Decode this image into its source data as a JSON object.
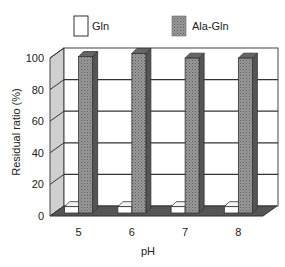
{
  "chart_data": {
    "type": "bar",
    "style": "3d-grouped",
    "title": "",
    "xlabel": "pH",
    "ylabel": "Residual ratio (%)",
    "categories": [
      "5",
      "6",
      "7",
      "8"
    ],
    "series": [
      {
        "name": "Gln",
        "values": [
          4,
          4,
          4,
          4
        ],
        "color": "#ffffff"
      },
      {
        "name": "Ala-Gln",
        "values": [
          99,
          101,
          98,
          98
        ],
        "color": "#8a8a8a"
      }
    ],
    "ylim": [
      0,
      100
    ],
    "yticks": [
      0,
      20,
      40,
      60,
      80,
      100
    ],
    "grid": true,
    "legend_position": "top"
  },
  "legend": {
    "gln": "Gln",
    "ala_gln": "Ala-Gln"
  },
  "axes": {
    "xlabel": "pH",
    "ylabel": "Residual ratio (%)",
    "yticks": [
      "0",
      "20",
      "40",
      "60",
      "80",
      "100"
    ],
    "xticks": [
      "5",
      "6",
      "7",
      "8"
    ]
  }
}
